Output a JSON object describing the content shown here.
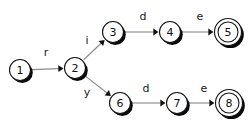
{
  "diagram": {
    "type": "finite-state-automaton",
    "background_color": "#ffffff",
    "width": 252,
    "height": 127,
    "node_stroke_color": "#141414",
    "node_fill_color": "#ffffff",
    "node_shadow_color": "#0a0a0a",
    "edge_color": "#8c8c8c",
    "arrowhead_color": "#111111",
    "nodes": [
      {
        "id": "1",
        "label": "1",
        "cx": 20,
        "cy": 70,
        "r": 10.5,
        "accepting": false
      },
      {
        "id": "2",
        "label": "2",
        "cx": 75,
        "cy": 68,
        "r": 10.5,
        "accepting": false
      },
      {
        "id": "3",
        "label": "3",
        "cx": 113,
        "cy": 32,
        "r": 10.5,
        "accepting": false
      },
      {
        "id": "4",
        "label": "4",
        "cx": 170,
        "cy": 32,
        "r": 10.5,
        "accepting": false
      },
      {
        "id": "5",
        "label": "5",
        "cx": 228,
        "cy": 32,
        "r": 10.0,
        "accepting": true,
        "r_outer": 13.5
      },
      {
        "id": "6",
        "label": "6",
        "cx": 120,
        "cy": 103,
        "r": 10.5,
        "accepting": false
      },
      {
        "id": "7",
        "label": "7",
        "cx": 177,
        "cy": 103,
        "r": 10.5,
        "accepting": false
      },
      {
        "id": "8",
        "label": "8",
        "cx": 229,
        "cy": 103,
        "r": 10.0,
        "accepting": true,
        "r_outer": 13.5
      }
    ],
    "edges": [
      {
        "id": "e1",
        "from": "1",
        "to": "2",
        "label": "r",
        "label_x": 46,
        "label_y": 52
      },
      {
        "id": "e2",
        "from": "2",
        "to": "3",
        "label": "i",
        "label_x": 87,
        "label_y": 40
      },
      {
        "id": "e3",
        "from": "3",
        "to": "4",
        "label": "d",
        "label_x": 143,
        "label_y": 16
      },
      {
        "id": "e4",
        "from": "4",
        "to": "5",
        "label": "e",
        "label_x": 200,
        "label_y": 16
      },
      {
        "id": "e5",
        "from": "2",
        "to": "6",
        "label": "y",
        "label_x": 87,
        "label_y": 92
      },
      {
        "id": "e6",
        "from": "6",
        "to": "7",
        "label": "d",
        "label_x": 146,
        "label_y": 88
      },
      {
        "id": "e7",
        "from": "7",
        "to": "8",
        "label": "e",
        "label_x": 204,
        "label_y": 88
      }
    ]
  }
}
